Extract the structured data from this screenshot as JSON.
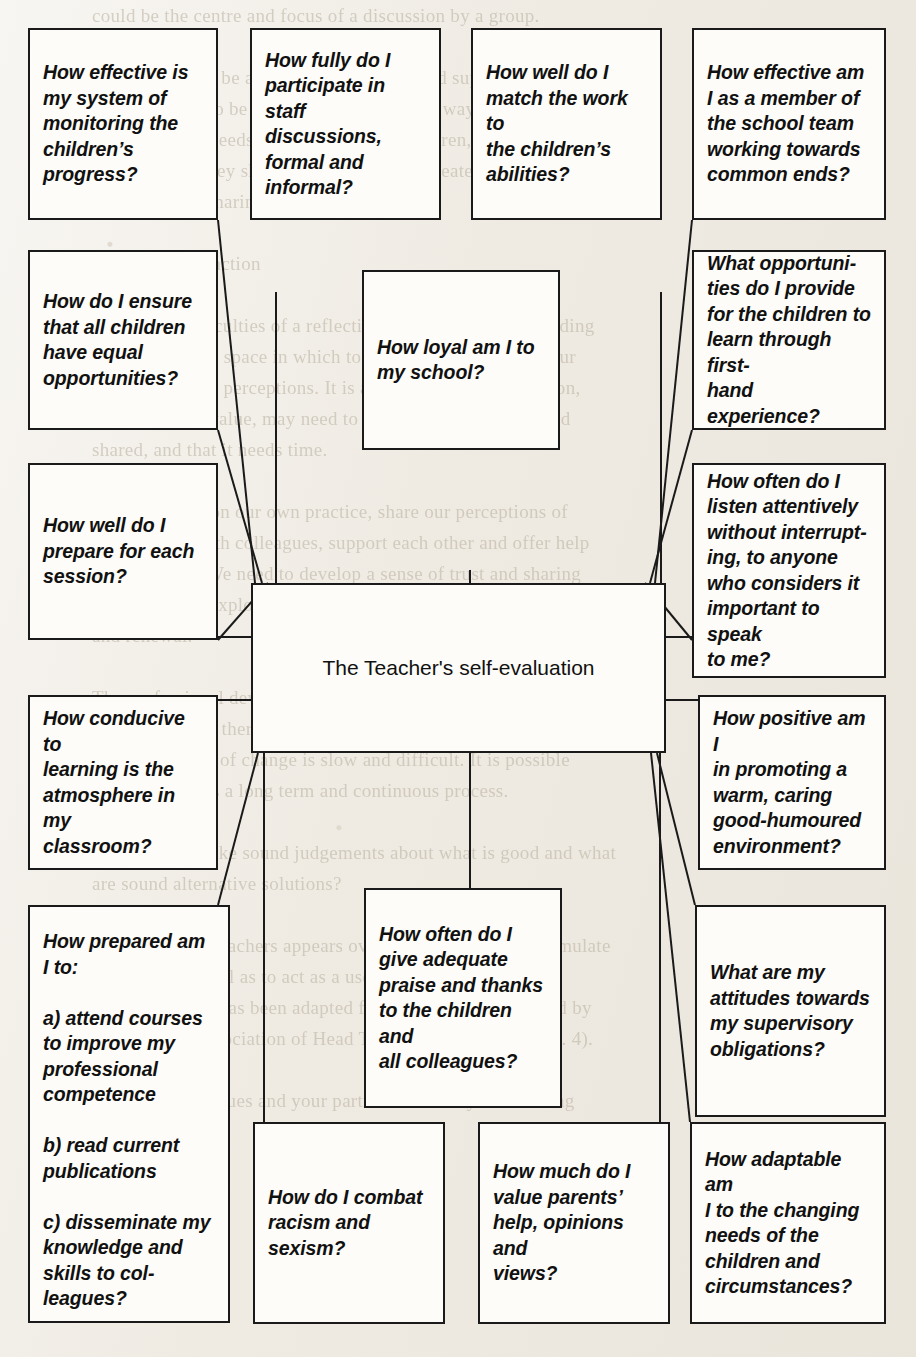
{
  "diagram": {
    "title": "The Teacher's self-evaluation",
    "center": {
      "label": "The Teacher's self-evaluation"
    },
    "nodes": [
      {
        "id": "monitoring",
        "label": "How effective is\nmy system of\nmonitoring the\nchildren’s\nprogress?"
      },
      {
        "id": "staff-discussions",
        "label": "How fully do I\nparticipate in staff\ndiscussions,\nformal and\ninformal?"
      },
      {
        "id": "match-work",
        "label": "How well do I\nmatch the work to\nthe children’s\nabilities?"
      },
      {
        "id": "school-team",
        "label": "How effective am\nI as a member of\nthe school team\nworking towards\ncommon ends?"
      },
      {
        "id": "equal-opportunities",
        "label": "How do I ensure\nthat all children\nhave equal\nopportunities?"
      },
      {
        "id": "loyal",
        "label": "How loyal am I to\nmy school?"
      },
      {
        "id": "first-hand-experience",
        "label": "What opportuni-\nties do I provide\nfor the children to\nlearn through first-\nhand experience?"
      },
      {
        "id": "prepare-session",
        "label": "How well do I\nprepare for each\nsession?"
      },
      {
        "id": "listen-attentively",
        "label": "How often do I\nlisten attentively\nwithout interrupt-\ning, to anyone\nwho considers it\nimportant to speak\nto me?"
      },
      {
        "id": "classroom-atmosphere",
        "label": "How conducive to\nlearning is the\natmosphere in my\nclassroom?"
      },
      {
        "id": "warm-environment",
        "label": "How positive am I\nin promoting a\nwarm, caring\ngood-humoured\nenvironment?"
      },
      {
        "id": "professional-development",
        "label": "How prepared am\nI to:\n\na) attend courses\nto improve my\nprofessional\ncompetence\n\nb) read current\npublications\n\nc) disseminate my\nknowledge and\nskills to col-\nleagues?"
      },
      {
        "id": "praise-thanks",
        "label": "How often do I\ngive adequate\npraise and thanks\nto the children and\nall colleagues?"
      },
      {
        "id": "supervisory-attitudes",
        "label": "What are my\nattitudes towards\nmy supervisory\nobligations?"
      },
      {
        "id": "racism-sexism",
        "label": "How do I combat\nracism and\nsexism?"
      },
      {
        "id": "value-parents",
        "label": "How much do I\nvalue parents’\nhelp, opinions and\nviews?"
      },
      {
        "id": "adaptable",
        "label": "How adaptable am\nI to the changing\nneeds of the\nchildren and\ncircumstances?"
      }
    ],
    "colors": {
      "line": "#1a1a1a",
      "box_fill": "#fdfcf8",
      "paper": "#efebe3",
      "text": "#111111"
    }
  },
  "background_text": {
    "bleed_through": "could be the centre and focus of a discussion by a group.\n\nteaching should be about encouragement and support, for example,\nwould we like to be treated in the following way? If we are to\nrespond to the needs of colleagues and children, and to the\nconcerns that they share with us, we must create the conditions\nin which such sharing can take place.\n\nReflection and action\n\nOne of the difficulties of a reflective approach is that of finding\nthe time and the space in which to reflect and think about our\nexperiences and perceptions. It is also the case that reflection,\nif it is to be of value, may need to be structured, focused and\nshared, and that it needs time.\n\nWe can reflect on our own practice, share our perceptions of\nour teaching with colleagues, support each other and offer help\nand guidance. We need to develop a sense of trust and sharing\nso that we can explore and plan together a programme of change\nand renewal.\n\nThe professional development of teachers depends upon the\nrecognition that there is a need for change and improvement and\nthat the process of change is slow and difficult. It is possible\nto see change as a long term and continuous process.\n\nHow can we make sound judgements about what is good and what\nare sound alternative solutions?\n\nA checklist for teachers appears overleaf. It may help to stimulate\ndiscussion as well as to act as a useful set of indicators of\nperformance. It has been adapted from a checklist published by\nthe National Association of Head Teachers (NAHT, 1990, p. 4).\n\nAsk your colleagues and your partners how far your teaching"
  }
}
